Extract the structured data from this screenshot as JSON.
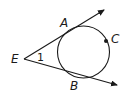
{
  "diagram": {
    "type": "geometry-tangents-to-circle",
    "stroke_color": "#1a1a1a",
    "background": "#ffffff",
    "points": {
      "E": {
        "label": "E"
      },
      "A": {
        "label": "A"
      },
      "B": {
        "label": "B"
      },
      "C": {
        "label": "C"
      }
    },
    "angle_label": "1",
    "elements": [
      {
        "kind": "ray",
        "from": "E",
        "through": "A",
        "description": "tangent ray EA"
      },
      {
        "kind": "ray",
        "from": "E",
        "through": "B",
        "description": "tangent ray EB"
      },
      {
        "kind": "circle",
        "description": "circle tangent to both rays at A and B, passing through C"
      },
      {
        "kind": "point",
        "name": "C",
        "description": "filled dot on circle"
      },
      {
        "kind": "angle",
        "vertex": "E",
        "label": "1"
      }
    ]
  }
}
